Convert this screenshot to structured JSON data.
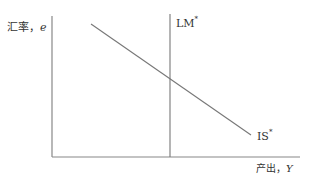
{
  "diagram": {
    "type": "Mundell-Fleming IS*-LM* diagram",
    "y_axis": {
      "label_prefix": "汇率，",
      "label_var": "e"
    },
    "x_axis": {
      "label_prefix": "产出，",
      "label_var": "Y"
    },
    "curves": [
      {
        "name": "LM",
        "sup": "*",
        "shape": "vertical"
      },
      {
        "name": "IS",
        "sup": "*",
        "shape": "downward-sloping"
      }
    ],
    "colors": {
      "axis": "#808080",
      "curve": "#707070",
      "text": "#333333"
    }
  }
}
